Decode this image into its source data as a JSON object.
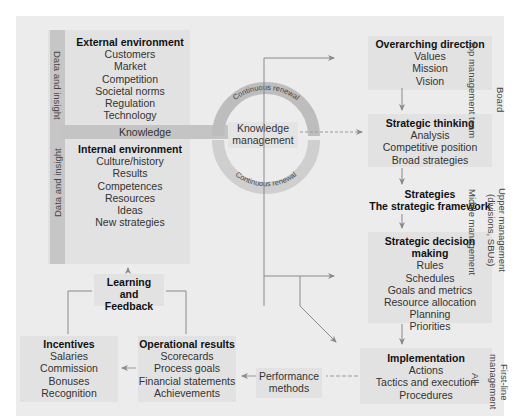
{
  "diagram": {
    "left_panel": {
      "side_band_top": "Data and insight",
      "side_band_bottom": "Data and insight",
      "external": {
        "title": "External environment",
        "items": [
          "Customers",
          "Market",
          "Competition",
          "Societal norms",
          "Regulation",
          "Technology"
        ]
      },
      "knowledge_band": "Knowledge",
      "internal": {
        "title": "Internal environment",
        "items": [
          "Culture/history",
          "Results",
          "Competences",
          "Resources",
          "Ideas",
          "New strategies"
        ]
      }
    },
    "center": {
      "ring_top_label": "Continuous renewal",
      "ring_bottom_label": "Continuous renewal",
      "hub_line1": "Knowledge",
      "hub_line2": "management"
    },
    "right_column": {
      "overarching": {
        "title": "Overarching direction",
        "items": [
          "Values",
          "Mission",
          "Vision"
        ]
      },
      "thinking": {
        "title": "Strategic thinking",
        "items": [
          "Analysis",
          "Competitive position",
          "Broad strategies"
        ]
      },
      "strategies": {
        "title": "Strategies",
        "subtitle": "The strategic framework"
      },
      "decision": {
        "title": "Strategic decision making",
        "items": [
          "Rules",
          "Schedules",
          "Goals and metrics",
          "Resource allocation",
          "Planning",
          "Priorities"
        ]
      },
      "implementation": {
        "title": "Implementation",
        "items": [
          "Actions",
          "Tactics and execution",
          "Procedures"
        ]
      }
    },
    "management_levels": {
      "top_team": "Top management team",
      "board": "Board",
      "middle": "Middle management",
      "upper_line1": "Upper management",
      "upper_line2": "(divisions, SBUs)",
      "all": "All",
      "first_line1": "First-line",
      "first_line2": "management"
    },
    "bottom_row": {
      "learning": {
        "line1": "Learning",
        "line2": "and Feedback"
      },
      "incentives": {
        "title": "Incentives",
        "items": [
          "Salaries",
          "Commission",
          "Bonuses",
          "Recognition"
        ]
      },
      "operational": {
        "title": "Operational results",
        "items": [
          "Scorecards",
          "Process goals",
          "Financial statements",
          "Achievements"
        ]
      },
      "performance": {
        "line1": "Performance",
        "line2": "methods"
      }
    },
    "colors": {
      "background": "#ececec",
      "box": "#e2e2e2",
      "band": "#c4c4c4",
      "ring": "#bdbdbd",
      "arrow": "#8a8a8a"
    }
  }
}
